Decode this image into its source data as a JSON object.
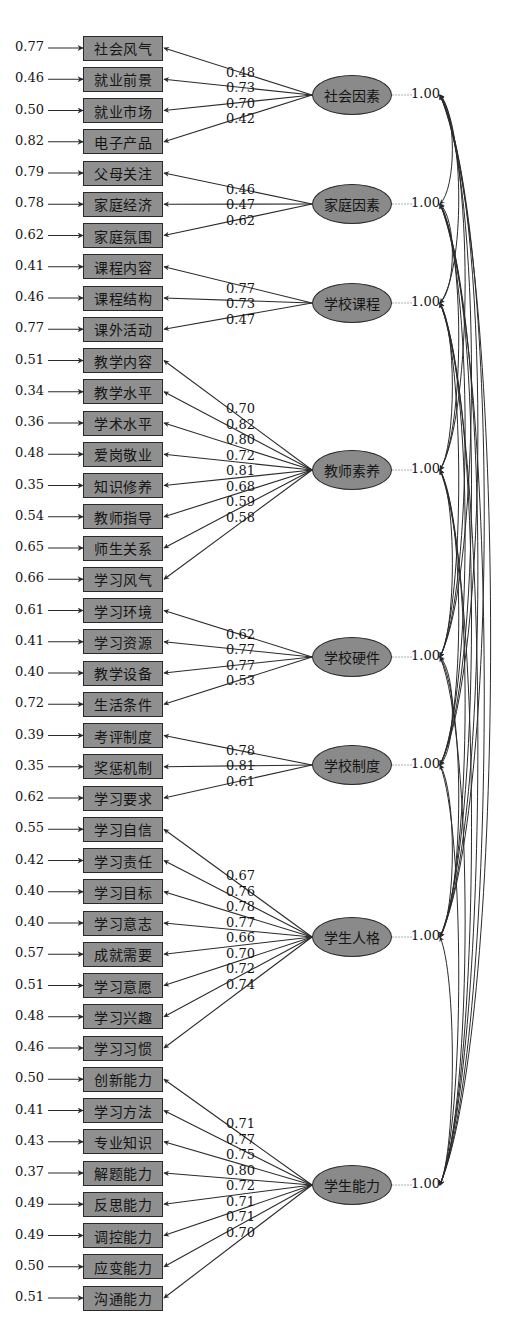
{
  "diagram": {
    "type": "confirmatory-factor-analysis-path-diagram",
    "factors": [
      {
        "name": "社会因素",
        "variance": "1.00",
        "cy": 95,
        "indicators": [
          {
            "name": "社会风气",
            "error": "0.77",
            "loading": "0.48"
          },
          {
            "name": "就业前景",
            "error": "0.46",
            "loading": "0.73"
          },
          {
            "name": "就业市场",
            "error": "0.50",
            "loading": "0.70"
          },
          {
            "name": "电子产品",
            "error": "0.82",
            "loading": "0.42"
          }
        ]
      },
      {
        "name": "家庭因素",
        "variance": "1.00",
        "cy": 204,
        "indicators": [
          {
            "name": "父母关注",
            "error": "0.79",
            "loading": "0.46"
          },
          {
            "name": "家庭经济",
            "error": "0.78",
            "loading": "0.47"
          },
          {
            "name": "家庭氛围",
            "error": "0.62",
            "loading": "0.62"
          }
        ]
      },
      {
        "name": "学校课程",
        "variance": "1.00",
        "cy": 303,
        "indicators": [
          {
            "name": "课程内容",
            "error": "0.41",
            "loading": "0.77"
          },
          {
            "name": "课程结构",
            "error": "0.46",
            "loading": "0.73"
          },
          {
            "name": "课外活动",
            "error": "0.77",
            "loading": "0.47"
          }
        ]
      },
      {
        "name": "教师素养",
        "variance": "1.00",
        "cy": 470,
        "indicators": [
          {
            "name": "教学内容",
            "error": "0.51",
            "loading": "0.70"
          },
          {
            "name": "教学水平",
            "error": "0.34",
            "loading": "0.82"
          },
          {
            "name": "学术水平",
            "error": "0.36",
            "loading": "0.80"
          },
          {
            "name": "爱岗敬业",
            "error": "0.48",
            "loading": "0.72"
          },
          {
            "name": "知识修养",
            "error": "0.35",
            "loading": "0.81"
          },
          {
            "name": "教师指导",
            "error": "0.54",
            "loading": "0.68"
          },
          {
            "name": "师生关系",
            "error": "0.65",
            "loading": "0.59"
          },
          {
            "name": "学习风气",
            "error": "0.66",
            "loading": "0.58"
          }
        ]
      },
      {
        "name": "学校硬件",
        "variance": "1.00",
        "cy": 657,
        "indicators": [
          {
            "name": "学习环境",
            "error": "0.61",
            "loading": "0.62"
          },
          {
            "name": "学习资源",
            "error": "0.41",
            "loading": "0.77"
          },
          {
            "name": "教学设备",
            "error": "0.40",
            "loading": "0.77"
          },
          {
            "name": "生活条件",
            "error": "0.72",
            "loading": "0.53"
          }
        ]
      },
      {
        "name": "学校制度",
        "variance": "1.00",
        "cy": 765,
        "indicators": [
          {
            "name": "考评制度",
            "error": "0.39",
            "loading": "0.78"
          },
          {
            "name": "奖惩机制",
            "error": "0.35",
            "loading": "0.81"
          },
          {
            "name": "学习要求",
            "error": "0.62",
            "loading": "0.61"
          }
        ]
      },
      {
        "name": "学生人格",
        "variance": "1.00",
        "cy": 937,
        "indicators": [
          {
            "name": "学习自信",
            "error": "0.55",
            "loading": "0.67"
          },
          {
            "name": "学习责任",
            "error": "0.42",
            "loading": "0.76"
          },
          {
            "name": "学习目标",
            "error": "0.40",
            "loading": "0.78"
          },
          {
            "name": "学习意志",
            "error": "0.40",
            "loading": "0.77"
          },
          {
            "name": "成就需要",
            "error": "0.57",
            "loading": "0.66"
          },
          {
            "name": "学习意愿",
            "error": "0.51",
            "loading": "0.70"
          },
          {
            "name": "学习兴趣",
            "error": "0.48",
            "loading": "0.72"
          },
          {
            "name": "学习习惯",
            "error": "0.46",
            "loading": "0.74"
          }
        ]
      },
      {
        "name": "学生能力",
        "variance": "1.00",
        "cy": 1185,
        "indicators": [
          {
            "name": "创新能力",
            "error": "0.50",
            "loading": "0.71"
          },
          {
            "name": "学习方法",
            "error": "0.41",
            "loading": "0.77"
          },
          {
            "name": "专业知识",
            "error": "0.43",
            "loading": "0.75"
          },
          {
            "name": "解题能力",
            "error": "0.37",
            "loading": "0.80"
          },
          {
            "name": "反思能力",
            "error": "0.49",
            "loading": "0.72"
          },
          {
            "name": "调控能力",
            "error": "0.49",
            "loading": "0.71"
          },
          {
            "name": "应变能力",
            "error": "0.50",
            "loading": "0.71"
          },
          {
            "name": "沟通能力",
            "error": "0.51",
            "loading": "0.70"
          }
        ]
      }
    ],
    "colors": {
      "node_fill": "#8c8c8c",
      "stroke": "#2a2a2a",
      "text": "#151515",
      "background": "#ffffff"
    }
  }
}
